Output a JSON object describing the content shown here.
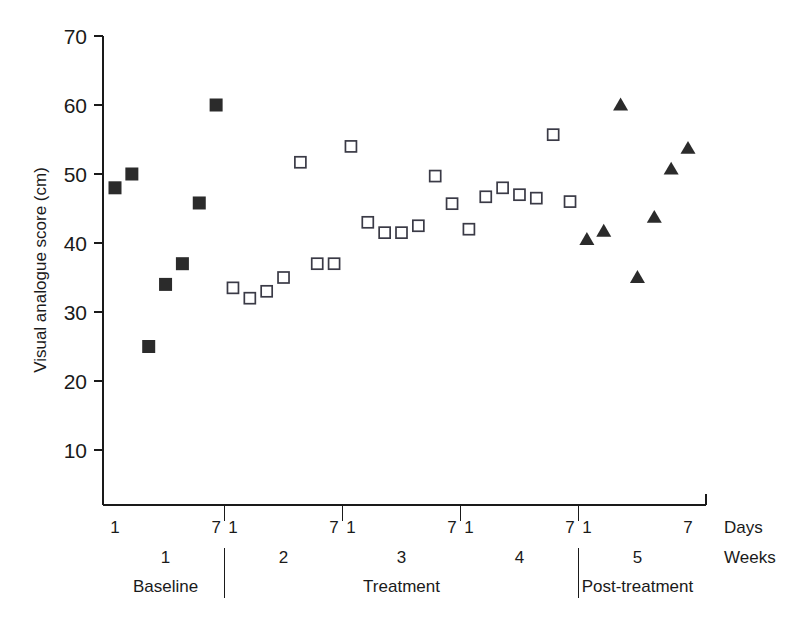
{
  "chart_data": {
    "type": "scatter",
    "title": "",
    "xlabel": "Days",
    "ylabel": "Visual analogue score (cm)",
    "ylim": [
      0,
      70
    ],
    "xlim": [
      0.5,
      35.5
    ],
    "grid": false,
    "legend": "none",
    "y_ticks": [
      10,
      20,
      30,
      40,
      50,
      60,
      70
    ],
    "y_tick_labels": [
      "10",
      "20",
      "30",
      "40",
      "50",
      "60",
      "70"
    ],
    "axis_side_labels": {
      "days": "Days",
      "weeks": "Weeks"
    },
    "week_numbers": [
      "1",
      "2",
      "3",
      "4",
      "5"
    ],
    "day_edge_labels": [
      "1",
      "7"
    ],
    "phases": [
      {
        "label": "Baseline",
        "weeks": [
          1
        ]
      },
      {
        "label": "Treatment",
        "weeks": [
          2,
          3,
          4
        ]
      },
      {
        "label": "Post-treatment",
        "weeks": [
          5
        ]
      }
    ],
    "series": [
      {
        "name": "Baseline",
        "marker": "filled-square",
        "color": "#2b2b2b",
        "points": [
          {
            "day": 1,
            "value": 48
          },
          {
            "day": 2,
            "value": 50
          },
          {
            "day": 3,
            "value": 25
          },
          {
            "day": 4,
            "value": 34
          },
          {
            "day": 5,
            "value": 37
          },
          {
            "day": 6,
            "value": 45.8
          },
          {
            "day": 7,
            "value": 60
          }
        ]
      },
      {
        "name": "Treatment",
        "marker": "open-square",
        "color": "#3a3a46",
        "points": [
          {
            "day": 8,
            "value": 33.5
          },
          {
            "day": 9,
            "value": 32
          },
          {
            "day": 10,
            "value": 33
          },
          {
            "day": 11,
            "value": 35
          },
          {
            "day": 12,
            "value": 51.7
          },
          {
            "day": 13,
            "value": 37
          },
          {
            "day": 14,
            "value": 37
          },
          {
            "day": 15,
            "value": 54
          },
          {
            "day": 16,
            "value": 43
          },
          {
            "day": 17,
            "value": 41.5
          },
          {
            "day": 18,
            "value": 41.5
          },
          {
            "day": 19,
            "value": 42.5
          },
          {
            "day": 20,
            "value": 49.7
          },
          {
            "day": 21,
            "value": 45.7
          },
          {
            "day": 22,
            "value": 42
          },
          {
            "day": 23,
            "value": 46.7
          },
          {
            "day": 24,
            "value": 48
          },
          {
            "day": 25,
            "value": 47
          },
          {
            "day": 26,
            "value": 46.5
          },
          {
            "day": 27,
            "value": 55.7
          },
          {
            "day": 28,
            "value": 46
          }
        ]
      },
      {
        "name": "Post-treatment",
        "marker": "filled-triangle",
        "color": "#2b2b2b",
        "points": [
          {
            "day": 29,
            "value": 40.5
          },
          {
            "day": 30,
            "value": 41.7
          },
          {
            "day": 31,
            "value": 60
          },
          {
            "day": 32,
            "value": 35
          },
          {
            "day": 33,
            "value": 43.7
          },
          {
            "day": 34,
            "value": 50.7
          },
          {
            "day": 35,
            "value": 53.7
          }
        ]
      }
    ]
  }
}
